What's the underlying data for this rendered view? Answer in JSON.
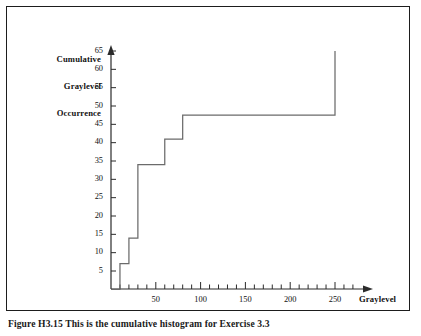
{
  "figure": {
    "caption": "Figure H3.15  This is the cumulative histogram for Exercise 3.3",
    "frame_color": "#1d1d1d",
    "background": "#ffffff"
  },
  "chart_data": {
    "type": "line",
    "subtype": "step-post",
    "title": "",
    "ylabel": "Cumulative Graylevel Occurrence",
    "ylabel_lines": [
      "Cumulative",
      "Graylevel",
      "Occurrence"
    ],
    "xlabel": "Graylevel",
    "xlim": [
      0,
      275
    ],
    "ylim": [
      0,
      68
    ],
    "grid": false,
    "legend": null,
    "line_color": "#6b6b6b",
    "axis_color": "#2b2b2b",
    "x_ticks_major": [
      50,
      100,
      150,
      200,
      250
    ],
    "x_tick_labels": [
      "50",
      "100",
      "150",
      "200",
      "250"
    ],
    "x_ticks_minor": [
      10,
      20,
      30,
      40,
      60,
      70,
      80,
      90,
      110,
      120,
      130,
      140,
      160,
      170,
      180,
      190,
      210,
      220,
      230,
      240,
      260,
      270
    ],
    "y_ticks": [
      5,
      10,
      15,
      20,
      25,
      30,
      35,
      40,
      45,
      50,
      55,
      60,
      65
    ],
    "y_tick_labels": [
      "5",
      "10",
      "15",
      "20",
      "25",
      "30",
      "35",
      "40",
      "45",
      "50",
      "55",
      "60",
      "65"
    ],
    "x": [
      0,
      10,
      20,
      30,
      60,
      80,
      250
    ],
    "values": [
      0,
      7,
      14,
      34,
      41,
      47.5,
      65
    ],
    "points": [
      {
        "graylevel": 0,
        "cumulative": 0
      },
      {
        "graylevel": 10,
        "cumulative": 7
      },
      {
        "graylevel": 20,
        "cumulative": 14
      },
      {
        "graylevel": 30,
        "cumulative": 34
      },
      {
        "graylevel": 60,
        "cumulative": 41
      },
      {
        "graylevel": 80,
        "cumulative": 47.5
      },
      {
        "graylevel": 250,
        "cumulative": 65
      }
    ],
    "annotations": []
  }
}
